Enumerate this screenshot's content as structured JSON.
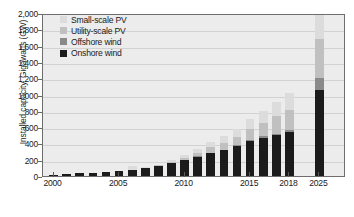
{
  "chart_data": {
    "type": "bar",
    "title": "",
    "subtitle": "",
    "stacked": true,
    "xlabel": "",
    "ylabel": "Installed capacity, Gigawatts (GW)",
    "ylim": [
      0,
      2000
    ],
    "ytick_values": [
      0,
      200,
      400,
      600,
      800,
      1000,
      1200,
      1400,
      1600,
      1800,
      2000
    ],
    "ytick_labels": [
      "0",
      "200",
      "400",
      "600",
      "800",
      "1,000",
      "1,200",
      "1,400",
      "1,600",
      "1,800",
      "2,000"
    ],
    "xtick_labels": [
      "2000",
      "2005",
      "2010",
      "2015",
      "2018",
      "2025"
    ],
    "grid": true,
    "legend_position": "top-left",
    "legend": [
      {
        "name": "Small-scale PV",
        "color": "#dcdcdc"
      },
      {
        "name": "Utility-scale PV",
        "color": "#c0c0c0"
      },
      {
        "name": "Offshore wind",
        "color": "#8a8a8a"
      },
      {
        "name": "Onshore wind",
        "color": "#1b1b1b"
      }
    ],
    "categories": [
      "2000",
      "2001",
      "2002",
      "2003",
      "2004",
      "2005",
      "2006",
      "2007",
      "2008",
      "2009",
      "2010",
      "2011",
      "2012",
      "2013",
      "2014",
      "2015",
      "2016",
      "2017",
      "2018",
      "2025"
    ],
    "series": [
      {
        "name": "Onshore wind",
        "color": "#1b1b1b",
        "values": [
          17,
          24,
          31,
          39,
          47,
          59,
          74,
          94,
          121,
          159,
          198,
          238,
          283,
          318,
          370,
          433,
          472,
          500,
          540,
          1050
        ]
      },
      {
        "name": "Offshore wind",
        "color": "#8a8a8a",
        "values": [
          0,
          0,
          0,
          1,
          1,
          1,
          1,
          1,
          2,
          2,
          3,
          4,
          5,
          7,
          8,
          12,
          14,
          19,
          23,
          150
        ]
      },
      {
        "name": "Utility-scale PV",
        "color": "#c0c0c0",
        "values": [
          0,
          0,
          0,
          1,
          2,
          3,
          4,
          5,
          8,
          14,
          25,
          45,
          62,
          85,
          105,
          130,
          170,
          215,
          250,
          480
        ]
      },
      {
        "name": "Small-scale PV",
        "color": "#dcdcdc",
        "values": [
          0,
          0,
          1,
          1,
          2,
          3,
          40,
          6,
          10,
          17,
          28,
          48,
          62,
          80,
          98,
          120,
          145,
          175,
          200,
          300
        ]
      }
    ]
  }
}
